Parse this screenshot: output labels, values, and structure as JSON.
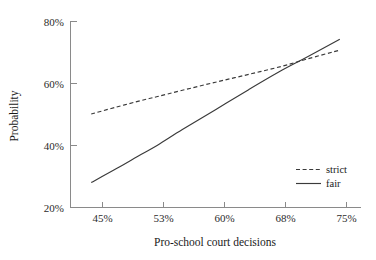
{
  "chart_data": {
    "type": "line",
    "title": "",
    "subtitle": "",
    "xlabel": "Pro-school court decisions",
    "ylabel": "Probability",
    "grid": false,
    "legend_position": "bottom-right inside plot area",
    "x_tick_labels": [
      "45%",
      "53%",
      "60%",
      "68%",
      "75%"
    ],
    "x_tick_values": [
      45,
      53,
      60,
      68,
      75
    ],
    "y_tick_labels": [
      "20%",
      "40%",
      "60%",
      "80%"
    ],
    "y_tick_values": [
      20,
      40,
      60,
      80
    ],
    "xlim": [
      42.5,
      77.5
    ],
    "ylim": [
      20,
      80
    ],
    "series": [
      {
        "name": "strict",
        "style": "dashed",
        "color": "#3a3a3a",
        "x": [
          45,
          48,
          51,
          53,
          56,
          60,
          64,
          68,
          71,
          75
        ],
        "values": [
          50.0,
          52.2,
          54.3,
          55.6,
          57.6,
          60.2,
          62.7,
          65.3,
          67.6,
          70.5
        ]
      },
      {
        "name": "fair",
        "style": "solid",
        "color": "#3a3a3a",
        "x": [
          45,
          48,
          51,
          53,
          56,
          60,
          64,
          68,
          71,
          75
        ],
        "values": [
          28.0,
          32.4,
          37.0,
          40.0,
          45.0,
          51.4,
          57.8,
          64.0,
          68.2,
          74.0
        ]
      }
    ],
    "annotations": [],
    "crossing_point": {
      "x": 68.9,
      "y": 67.0
    }
  },
  "legend": {
    "items": [
      {
        "label": "strict",
        "style": "dashed"
      },
      {
        "label": "fair",
        "style": "solid"
      }
    ]
  },
  "axes": {
    "x_title": "Pro-school court decisions",
    "y_title": "Probability"
  }
}
